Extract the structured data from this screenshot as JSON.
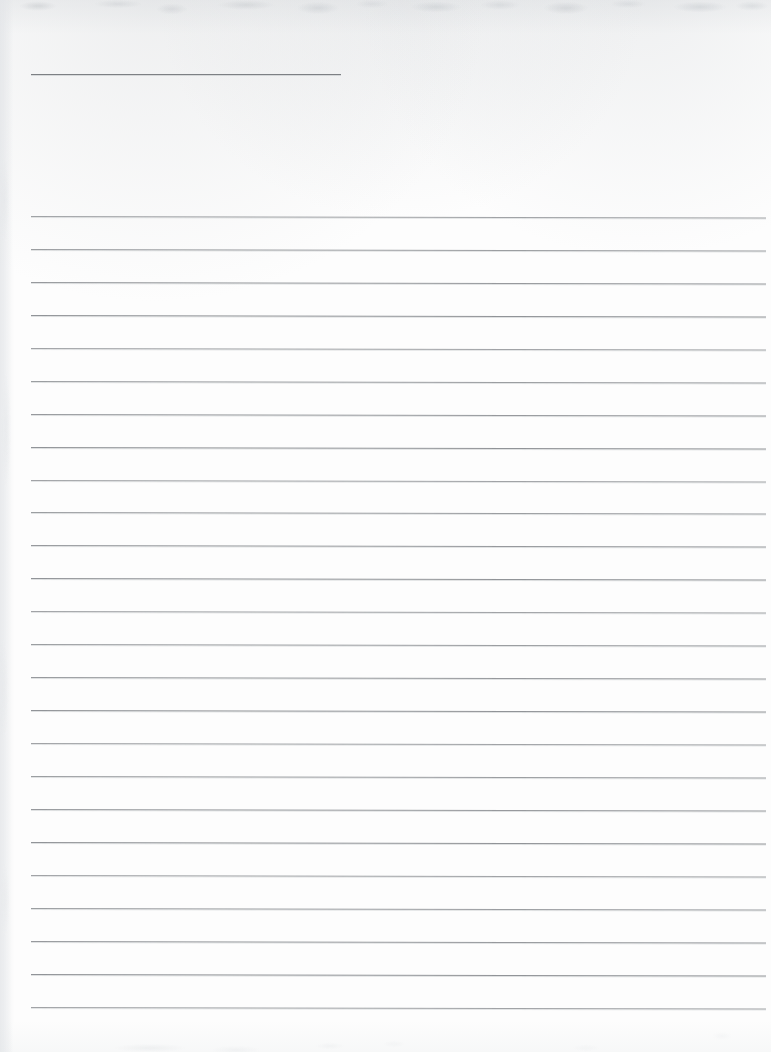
{
  "page": {
    "kind": "scanned-lined-paper",
    "width": 771,
    "height": 1052,
    "background_color": "#fdfdfd",
    "rule_color": "#8d9094",
    "content_text": "",
    "annotation": "Blank scanned ruled notebook page; no text content is present."
  },
  "header_rule": {
    "label": "header-rule",
    "x_start": 31,
    "x_end": 341,
    "y": 74,
    "thickness": 1,
    "color": "#7d8084"
  },
  "ruled_block": {
    "label": "ruled-lines",
    "x_start": 31,
    "x_end": 766,
    "line_count": 25,
    "first_line_y": 216,
    "line_spacing": 32.95,
    "thickness": 1,
    "color": "#8d9094",
    "tilt_deg": 0.12,
    "line_y_positions": [
      216,
      249,
      282,
      315,
      348,
      381,
      414,
      447,
      480,
      512,
      545,
      578,
      611,
      644,
      677,
      710,
      743,
      776,
      809,
      842,
      875,
      908,
      941,
      974,
      1007
    ]
  },
  "scan_artifacts": {
    "top_edge": "faint gray mottling",
    "left_edge": "faint vertical gray band",
    "bottom_edge": "very faint gray smudges"
  }
}
